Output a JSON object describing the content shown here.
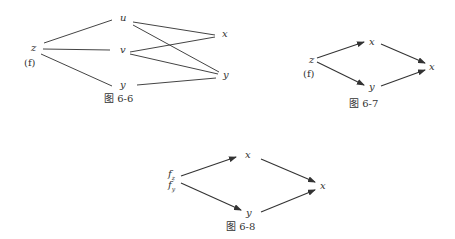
{
  "figures": [
    {
      "caption": "图 6-6",
      "type": "tree",
      "nodes": {
        "z": "z",
        "f": "(f)",
        "u": "u",
        "v": "v",
        "y_mid": "y",
        "x": "x",
        "y_right": "y"
      },
      "edges": [
        [
          "z",
          "u"
        ],
        [
          "z",
          "v"
        ],
        [
          "z",
          "y_mid"
        ],
        [
          "u",
          "x"
        ],
        [
          "u",
          "y_right"
        ],
        [
          "v",
          "x"
        ],
        [
          "v",
          "y_right"
        ],
        [
          "y_mid",
          "y_right"
        ]
      ]
    },
    {
      "caption": "图 6-7",
      "type": "directed",
      "nodes": {
        "z": "z",
        "f": "(f)",
        "x_mid": "x",
        "y_mid": "y",
        "x_right": "x"
      },
      "edges": [
        [
          "z",
          "x_mid"
        ],
        [
          "z",
          "y_mid"
        ],
        [
          "x_mid",
          "x_right"
        ],
        [
          "y_mid",
          "x_right"
        ]
      ]
    },
    {
      "caption": "图 6-8",
      "type": "directed",
      "nodes": {
        "fz": "f",
        "fz_sub": "z",
        "fy": "f",
        "fy_sub": "y",
        "x_mid": "x",
        "y_mid": "y",
        "x_right": "x"
      },
      "edges": [
        [
          "f",
          "x_mid"
        ],
        [
          "f",
          "y_mid"
        ],
        [
          "x_mid",
          "x_right"
        ],
        [
          "y_mid",
          "x_right"
        ]
      ]
    }
  ]
}
